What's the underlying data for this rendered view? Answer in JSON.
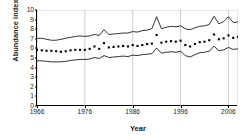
{
  "chart_data": {
    "type": "line",
    "title": "",
    "xlabel": "Year",
    "ylabel": "Abundance index",
    "xlim": [
      1966,
      2008
    ],
    "ylim": [
      0,
      10
    ],
    "ytick_labels": [
      "0",
      "1",
      "2",
      "3",
      "4",
      "5",
      "6",
      "7",
      "8",
      "9",
      "10"
    ],
    "ytick_values": [
      0,
      1,
      2,
      3,
      4,
      5,
      6,
      7,
      8,
      9,
      10
    ],
    "xtick_labels": [
      "1966",
      "1976",
      "1986",
      "1996",
      "2006"
    ],
    "xtick_values": [
      1966,
      1976,
      1986,
      1996,
      2006
    ],
    "grid": "vertical",
    "legend": "none",
    "x": [
      1966,
      1967,
      1968,
      1969,
      1970,
      1971,
      1972,
      1973,
      1974,
      1975,
      1976,
      1977,
      1978,
      1979,
      1980,
      1981,
      1982,
      1983,
      1984,
      1985,
      1986,
      1987,
      1988,
      1989,
      1990,
      1991,
      1992,
      1993,
      1994,
      1995,
      1996,
      1997,
      1998,
      1999,
      2000,
      2001,
      2002,
      2003,
      2004,
      2005,
      2006,
      2007,
      2008
    ],
    "series": [
      {
        "name": "Upper confidence limit",
        "style": "solid-line",
        "values": [
          7.05,
          7.05,
          6.95,
          6.85,
          6.85,
          6.95,
          7.05,
          7.15,
          7.25,
          7.3,
          7.25,
          7.3,
          7.45,
          7.35,
          7.95,
          7.45,
          7.5,
          7.55,
          7.6,
          7.6,
          7.75,
          7.7,
          7.85,
          7.9,
          8.05,
          9.3,
          8.05,
          8.2,
          8.3,
          8.25,
          8.35,
          8.05,
          7.95,
          8.15,
          8.3,
          8.35,
          8.5,
          9.35,
          8.55,
          8.8,
          9.3,
          8.7,
          8.75
        ]
      },
      {
        "name": "Abundance index (mean)",
        "style": "dotted-markers",
        "values": [
          5.85,
          5.8,
          5.75,
          5.75,
          5.7,
          5.65,
          5.7,
          5.8,
          5.85,
          5.85,
          5.85,
          5.95,
          6.2,
          5.95,
          6.55,
          6.1,
          6.15,
          6.2,
          6.25,
          6.2,
          6.35,
          6.25,
          6.35,
          6.45,
          6.5,
          7.4,
          6.6,
          6.7,
          6.75,
          6.7,
          6.8,
          6.35,
          6.2,
          6.45,
          6.65,
          6.7,
          6.85,
          7.45,
          6.95,
          7.05,
          7.35,
          7.1,
          7.2
        ]
      },
      {
        "name": "Lower confidence limit",
        "style": "solid-line",
        "values": [
          4.7,
          4.7,
          4.65,
          4.6,
          4.6,
          4.6,
          4.65,
          4.75,
          4.8,
          4.85,
          4.85,
          4.9,
          5.05,
          4.95,
          5.25,
          5.05,
          5.1,
          5.15,
          5.2,
          5.15,
          5.3,
          5.25,
          5.35,
          5.4,
          5.45,
          6.05,
          5.5,
          5.6,
          5.65,
          5.6,
          5.7,
          5.25,
          5.1,
          5.35,
          5.55,
          5.6,
          5.7,
          6.25,
          5.75,
          5.85,
          6.1,
          5.9,
          5.95
        ]
      }
    ]
  },
  "colors": {
    "line": "#000000",
    "marker": "#000000",
    "axis": "#000000",
    "grid": "#b9b9b9",
    "background": "#ffffff"
  }
}
